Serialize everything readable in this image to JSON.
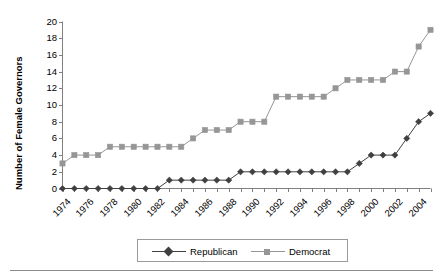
{
  "chart_data": {
    "type": "line",
    "title": "",
    "subtitle": "",
    "xlabel": "",
    "ylabel": "Number of Female Governors",
    "xlim": [
      1974,
      2005
    ],
    "ylim": [
      0,
      20
    ],
    "ytick_step": 2,
    "yticks": [
      0,
      2,
      4,
      6,
      8,
      10,
      12,
      14,
      16,
      18,
      20
    ],
    "xticks_labeled": [
      1974,
      1976,
      1978,
      1980,
      1982,
      1984,
      1986,
      1988,
      1990,
      1992,
      1994,
      1996,
      1998,
      2000,
      2002,
      2004
    ],
    "x": [
      1974,
      1975,
      1976,
      1977,
      1978,
      1979,
      1980,
      1981,
      1982,
      1983,
      1984,
      1985,
      1986,
      1987,
      1988,
      1989,
      1990,
      1991,
      1992,
      1993,
      1994,
      1995,
      1996,
      1997,
      1998,
      1999,
      2000,
      2001,
      2002,
      2003,
      2004,
      2005
    ],
    "grid": false,
    "legend_position": "bottom",
    "series": [
      {
        "name": "Republican",
        "color": "#404040",
        "marker": "diamond",
        "values": [
          0,
          0,
          0,
          0,
          0,
          0,
          0,
          0,
          0,
          1,
          1,
          1,
          1,
          1,
          1,
          2,
          2,
          2,
          2,
          2,
          2,
          2,
          2,
          2,
          2,
          3,
          4,
          4,
          4,
          6,
          8,
          9
        ]
      },
      {
        "name": "Democrat",
        "color": "#969696",
        "marker": "square",
        "values": [
          3,
          4,
          4,
          4,
          5,
          5,
          5,
          5,
          5,
          5,
          5,
          6,
          7,
          7,
          7,
          8,
          8,
          8,
          11,
          11,
          11,
          11,
          11,
          12,
          13,
          13,
          13,
          13,
          14,
          14,
          17,
          19
        ]
      }
    ]
  },
  "legend": {
    "items": [
      {
        "label": "Republican"
      },
      {
        "label": "Democrat"
      }
    ]
  }
}
